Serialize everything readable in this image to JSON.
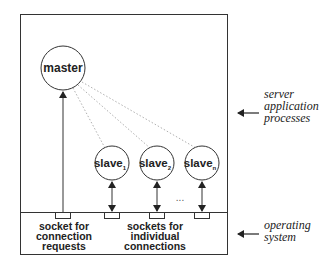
{
  "diagram": {
    "title": "",
    "nodes": {
      "master": {
        "label": "master"
      },
      "slaves": [
        {
          "label": "slave",
          "subscript": "1"
        },
        {
          "label": "slave",
          "subscript": "2"
        },
        {
          "label": "slave",
          "subscript": "n"
        }
      ],
      "ellipsis": "..."
    },
    "socket_labels": {
      "connection": [
        "socket for",
        "connection",
        "requests"
      ],
      "individual": [
        "sockets for",
        "individual",
        "connections"
      ]
    },
    "side_labels": {
      "server": [
        "server",
        "application",
        "processes"
      ],
      "os": [
        "operating",
        "system"
      ]
    },
    "colors": {
      "stroke": "#333333",
      "dotted": "#b0b0b0",
      "text": "#222222"
    }
  }
}
